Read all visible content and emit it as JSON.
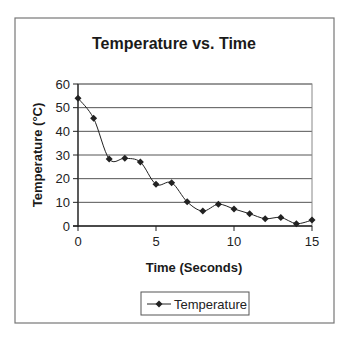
{
  "chart_data": {
    "type": "line",
    "title": "Temperature vs. Time",
    "xlabel": "Time (Seconds)",
    "ylabel": "Temperature (°C)",
    "x": [
      0,
      1,
      2,
      3,
      4,
      5,
      6,
      7,
      8,
      9,
      10,
      11,
      12,
      13,
      14,
      15
    ],
    "series": [
      {
        "name": "Temperature",
        "values": [
          54,
          45.5,
          28.3,
          28.6,
          27,
          17.6,
          18.3,
          10.2,
          6.3,
          9.2,
          7.2,
          5.2,
          3.1,
          3.6,
          1,
          2.5
        ],
        "marker": "diamond",
        "line": "smoothed",
        "color": "#222222"
      }
    ],
    "xlim": [
      0,
      15
    ],
    "ylim": [
      0,
      60
    ],
    "xticks": [
      0,
      5,
      10,
      15
    ],
    "yticks": [
      0,
      10,
      20,
      30,
      40,
      50,
      60
    ],
    "grid": {
      "horizontal": true,
      "vertical": false
    },
    "legend": {
      "position": "bottom",
      "entries": [
        "Temperature"
      ]
    }
  },
  "colors": {
    "background": "#ffffff",
    "border": "#777777",
    "gridline": "#555555",
    "series": "#222222"
  }
}
